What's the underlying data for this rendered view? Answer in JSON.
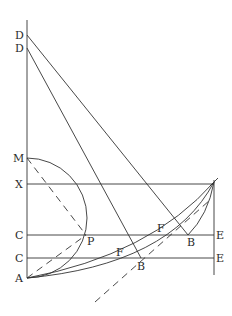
{
  "diagram": {
    "type": "geometric-construction",
    "labels": {
      "D_top": "D",
      "D_lower": "D",
      "M": "M",
      "X": "X",
      "C_upper": "C",
      "C_lower": "C",
      "A": "A",
      "P": "P",
      "F_upper": "F",
      "F_lower": "F",
      "B_upper": "B",
      "B_lower": "B",
      "E_upper": "E",
      "E_lower": "E"
    },
    "points": {
      "D1": [
        27,
        35
      ],
      "D2": [
        27,
        48
      ],
      "M": [
        27,
        158
      ],
      "X": [
        27,
        184
      ],
      "C1": [
        27,
        235
      ],
      "C2": [
        27,
        258
      ],
      "A": [
        27,
        278
      ],
      "P": [
        86,
        235
      ],
      "B1": [
        188,
        235
      ],
      "B2": [
        141,
        258
      ],
      "F1": [
        160,
        235
      ],
      "F2": [
        118,
        258
      ],
      "E1": [
        214,
        235
      ],
      "E2": [
        214,
        258
      ],
      "Top": [
        214,
        184
      ]
    },
    "colors": {
      "stroke": "#333333",
      "background": "#ffffff"
    }
  }
}
